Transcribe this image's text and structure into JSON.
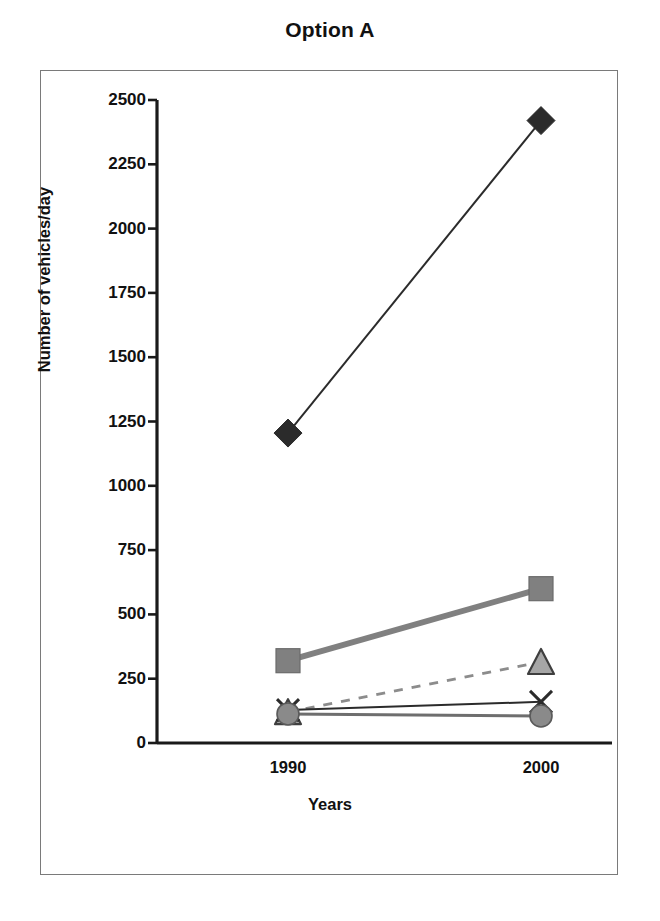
{
  "chart_data": {
    "type": "line",
    "title": "Option A",
    "xlabel": "Years",
    "ylabel": "Number of vehicles/day",
    "categories": [
      "1990",
      "2000"
    ],
    "x_tick_labels": [
      "1990",
      "2000"
    ],
    "y_tick_labels": [
      "0",
      "250",
      "500",
      "750",
      "1000",
      "1250",
      "1500",
      "1750",
      "2000",
      "2250",
      "2500"
    ],
    "y_ticks": [
      0,
      250,
      500,
      750,
      1000,
      1250,
      1500,
      1750,
      2000,
      2250,
      2500
    ],
    "ylim": [
      0,
      2500
    ],
    "grid": false,
    "legend": "none",
    "series": [
      {
        "name": "series-diamond",
        "marker": "diamond",
        "marker_color": "#2b2b2b",
        "line_color": "#2b2b2b",
        "line_style": "solid",
        "line_width": 2,
        "values": [
          1205,
          2420
        ]
      },
      {
        "name": "series-square",
        "marker": "square",
        "marker_color": "#808080",
        "line_color": "#808080",
        "line_style": "solid",
        "line_width": 6,
        "values": [
          320,
          600
        ]
      },
      {
        "name": "series-triangle",
        "marker": "triangle",
        "marker_color": "#a6a6a6",
        "line_color": "#8c8c8c",
        "line_style": "dashed",
        "line_width": 3,
        "values": [
          120,
          315
        ]
      },
      {
        "name": "series-cross",
        "marker": "x",
        "marker_color": "#2b2b2b",
        "line_color": "#2b2b2b",
        "line_style": "solid",
        "line_width": 2,
        "values": [
          128,
          160
        ]
      },
      {
        "name": "series-circle",
        "marker": "circle",
        "marker_color": "#8a8a8a",
        "line_color": "#6e6e6e",
        "line_style": "solid",
        "line_width": 3,
        "values": [
          113,
          105
        ]
      }
    ],
    "colors": {
      "axis": "#1a1a1a",
      "frame": "#7a7a7a",
      "text": "#111111",
      "background": "#ffffff"
    }
  }
}
